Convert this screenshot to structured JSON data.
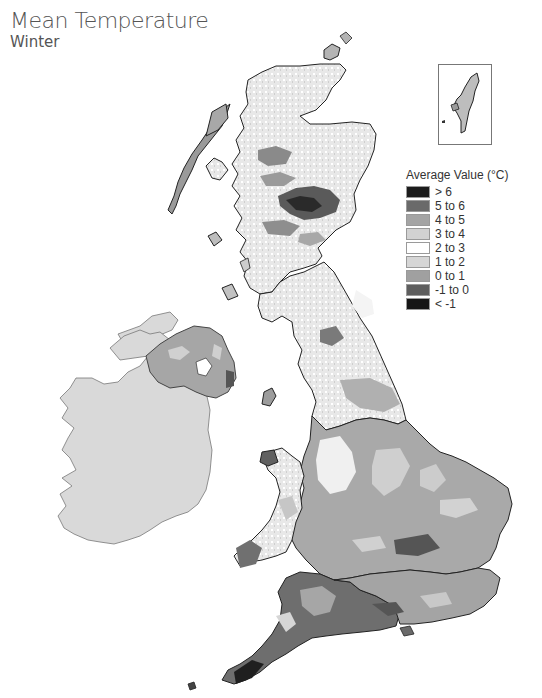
{
  "header": {
    "title": "Mean Temperature",
    "subtitle": "Winter"
  },
  "legend": {
    "title": "Average Value (°C)",
    "items": [
      {
        "label": "> 6",
        "color": "#1c1c1c"
      },
      {
        "label": "5 to 6",
        "color": "#6a6a6a"
      },
      {
        "label": "4 to 5",
        "color": "#a4a4a4"
      },
      {
        "label": "3 to 4",
        "color": "#d2d2d2"
      },
      {
        "label": "2 to 3",
        "color": "#ffffff"
      },
      {
        "label": "1 to 2",
        "color": "#d6d6d6"
      },
      {
        "label": "0 to 1",
        "color": "#a0a0a0"
      },
      {
        "label": "-1 to 0",
        "color": "#5e5e5e"
      },
      {
        "label": "< -1",
        "color": "#161616"
      }
    ]
  },
  "map": {
    "regions": [
      {
        "name": "Scotland",
        "shade": "mixed light/white with dark highlands"
      },
      {
        "name": "Northern Ireland",
        "shade": "mid-grey"
      },
      {
        "name": "Republic of Ireland",
        "shade": "light grey (no data)"
      },
      {
        "name": "Northern England",
        "shade": "white/light"
      },
      {
        "name": "Wales",
        "shade": "light with grey coasts"
      },
      {
        "name": "South-East England",
        "shade": "mid-grey"
      },
      {
        "name": "South-West England",
        "shade": "dark grey"
      }
    ],
    "inset": "Shetland Islands"
  }
}
